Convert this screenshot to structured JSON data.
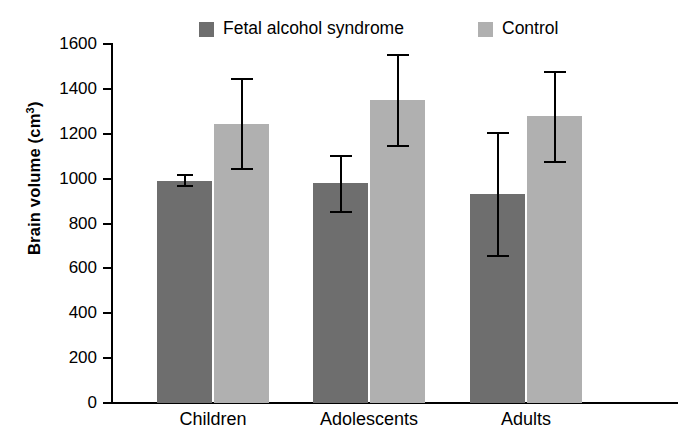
{
  "chart_data": {
    "type": "bar",
    "title": "",
    "subtitle": "",
    "xlabel": "",
    "ylabel": "Brain volume (cm3)",
    "ylabel_base": "Brain volume (cm",
    "ylabel_sup": "3",
    "ylabel_close": ")",
    "categories": [
      "Children",
      "Adolescents",
      "Adults"
    ],
    "ylim": [
      0,
      1600
    ],
    "yticks": [
      0,
      200,
      400,
      600,
      800,
      1000,
      1200,
      1400,
      1600
    ],
    "ytick_labels": [
      "0",
      "200",
      "400",
      "600",
      "800",
      "1000",
      "1200",
      "1400",
      "1600"
    ],
    "grid": false,
    "legend_position": "top",
    "error_bar_style": "capped-vertical",
    "series": [
      {
        "name": "Fetal alcohol syndrome",
        "color": "#6e6e6e",
        "values": [
          990,
          980,
          930
        ],
        "err_low": [
          965,
          850,
          655
        ],
        "err_high": [
          1015,
          1100,
          1205
        ]
      },
      {
        "name": "Control",
        "color": "#b0b0b0",
        "values": [
          1245,
          1350,
          1280
        ],
        "err_low": [
          1045,
          1145,
          1075
        ],
        "err_high": [
          1445,
          1550,
          1475
        ]
      }
    ]
  },
  "legend": {
    "entries": [
      {
        "label": "Fetal alcohol syndrome",
        "color": "#6e6e6e"
      },
      {
        "label": "Control",
        "color": "#b0b0b0"
      }
    ]
  },
  "colors": {
    "fetal_alcohol_syndrome": "#6e6e6e",
    "control": "#b0b0b0",
    "axis": "#000000",
    "background": "#ffffff"
  }
}
